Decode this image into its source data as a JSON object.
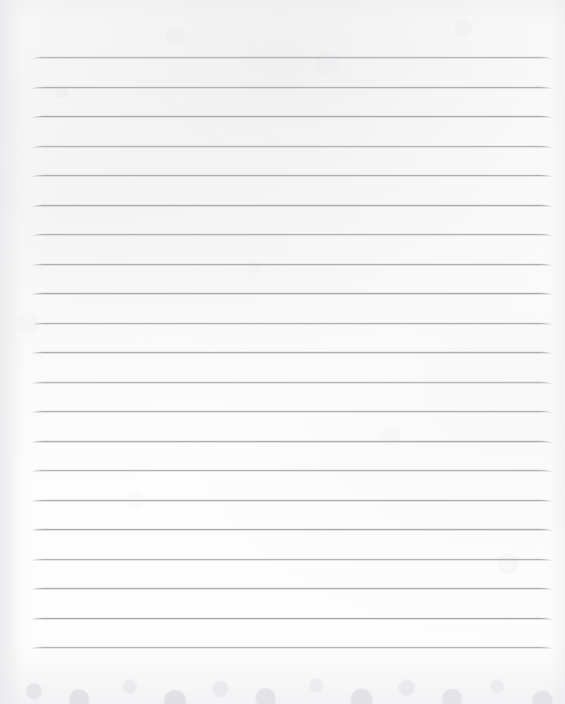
{
  "document": {
    "kind": "scanned-lined-paper",
    "title": "Blank Ruled Notebook Page",
    "content_text": "",
    "page_width": 565,
    "page_height": 704,
    "background_color": "#fdfdfd"
  },
  "ruling": {
    "rule_color": "#a9a9ae",
    "rule_thickness": 1,
    "rule_left": 33,
    "rule_right": 551,
    "rule_width": 518,
    "first_rule_y": 57,
    "line_spacing": 29.5,
    "rule_count": 21,
    "rule_y_positions": [
      57,
      86.5,
      116,
      145.5,
      175,
      204.5,
      234,
      263.5,
      293,
      322.5,
      352,
      381.5,
      411,
      440.5,
      470,
      499.5,
      529,
      558.5,
      588,
      617.5,
      647
    ]
  },
  "margins": {
    "top_margin": 57,
    "left_margin": 33,
    "right_margin": 14,
    "bottom_margin": 57
  },
  "scan_artifacts": {
    "bottom_band_label": "scan-edge-speckle",
    "bottom_band_height": 58,
    "grain_tone": "#ececee",
    "edge_shadow_tone": "#e9e9ec"
  }
}
